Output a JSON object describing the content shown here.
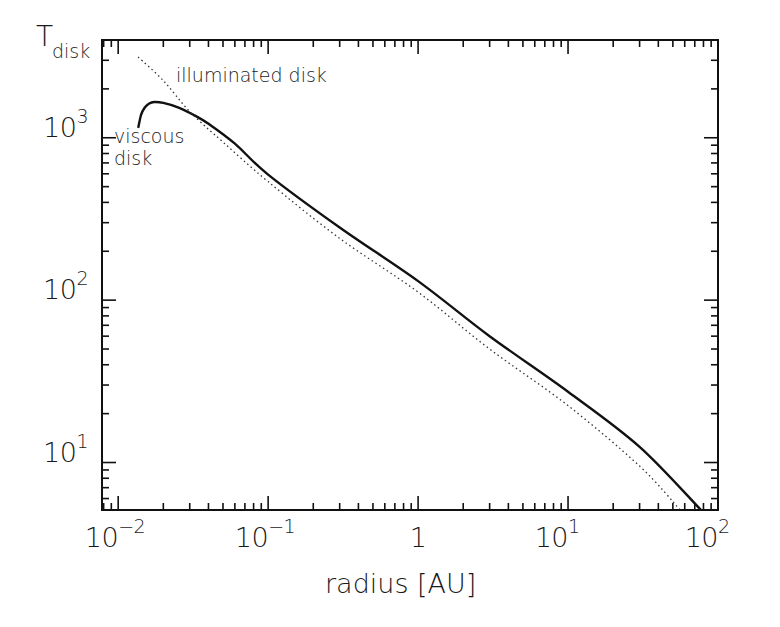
{
  "chart_data": {
    "type": "line",
    "title": "",
    "xlabel": "radius [AU]",
    "ylabel": "T",
    "ylabel_subscript": "disk",
    "xscale": "log",
    "yscale": "log",
    "xlim": [
      0.0078,
      100
    ],
    "ylim": [
      5.1,
      4000
    ],
    "grid": false,
    "legend": "none (inline annotations)",
    "x_ticks": [
      {
        "value": 0.01,
        "base": "10",
        "exp": "−2"
      },
      {
        "value": 0.1,
        "base": "10",
        "exp": "−1"
      },
      {
        "value": 1,
        "base": "1",
        "exp": ""
      },
      {
        "value": 10,
        "base": "10",
        "exp": "1"
      },
      {
        "value": 100,
        "base": "10",
        "exp": "2"
      }
    ],
    "y_ticks": [
      {
        "value": 10,
        "base": "10",
        "exp": "1"
      },
      {
        "value": 100,
        "base": "10",
        "exp": "2"
      },
      {
        "value": 1000,
        "base": "10",
        "exp": "3"
      }
    ],
    "series": [
      {
        "name": "viscous disk",
        "style": "solid",
        "color": "#111111",
        "x": [
          0.0136,
          0.0142,
          0.015,
          0.016,
          0.0174,
          0.02,
          0.025,
          0.032,
          0.04,
          0.06,
          0.1,
          0.3,
          1,
          3,
          10,
          30,
          77
        ],
        "y": [
          1150,
          1380,
          1530,
          1620,
          1660,
          1640,
          1540,
          1380,
          1220,
          920,
          593,
          280,
          131,
          60,
          27.3,
          12.5,
          5.1
        ]
      },
      {
        "name": "illuminated disk",
        "style": "dotted",
        "color": "#333333",
        "x": [
          0.0136,
          0.02,
          0.03,
          0.05,
          0.1,
          0.3,
          1,
          3,
          10,
          30,
          56
        ],
        "y": [
          3140,
          2250,
          1450,
          940,
          537,
          240,
          112,
          50,
          22.4,
          9.5,
          5.1
        ]
      }
    ],
    "annotations": [
      {
        "text": "illuminated disk",
        "target_series": "illuminated disk"
      },
      {
        "text": "viscous",
        "target_series": "viscous disk"
      },
      {
        "text": "disk",
        "target_series": "viscous disk"
      }
    ]
  },
  "labels": {
    "ylabel_main": "T",
    "ylabel_sub": "disk",
    "xlabel": "radius [AU]",
    "annot_illuminated": "illuminated disk",
    "annot_viscous_line1": "viscous",
    "annot_viscous_line2": "disk"
  },
  "colors": {
    "axis": "#111111",
    "curve": "#111111",
    "background": "#ffffff"
  }
}
